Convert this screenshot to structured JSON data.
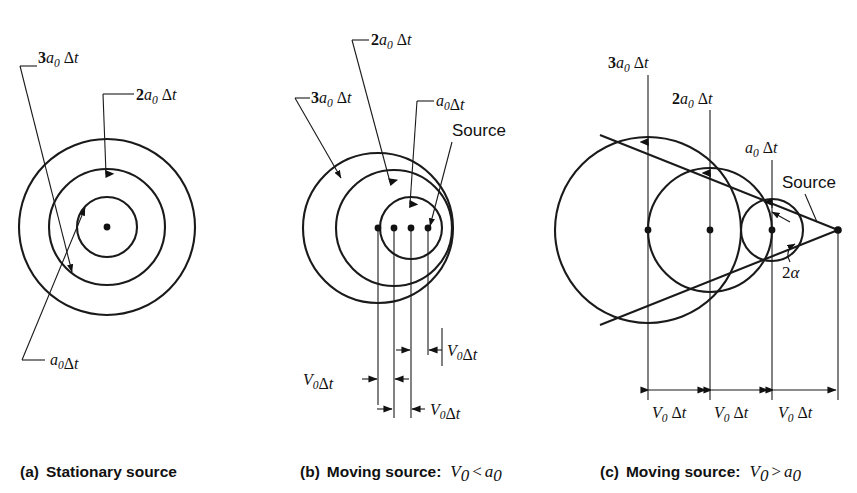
{
  "figure": {
    "background_color": "#ffffff",
    "ink_color": "#111111"
  },
  "panels": [
    {
      "id": "a",
      "caption_prefix": "(a)",
      "caption_text": "Stationary source",
      "caption_math": "",
      "description": "Three concentric circles around a single stationary source point",
      "source_label": "",
      "radius_labels": [
        {
          "name": "r3",
          "text": "3a0 Δt",
          "coef": "3",
          "symbol": "a",
          "sub": "0",
          "delta": "Δt"
        },
        {
          "name": "r2",
          "text": "2a0 Δt",
          "coef": "2",
          "symbol": "a",
          "sub": "0",
          "delta": "Δt"
        },
        {
          "name": "r1",
          "text": "a0 Δt",
          "coef": "",
          "symbol": "a",
          "sub": "0",
          "delta": "Δt"
        }
      ],
      "distance_labels": []
    },
    {
      "id": "b",
      "caption_prefix": "(b)",
      "caption_text": "Moving source:",
      "caption_math": "V0 < a0",
      "description": "Three non-concentric circles, subsonic source, four source positions",
      "source_label": "Source",
      "radius_labels": [
        {
          "name": "r3",
          "text": "3a0 Δt",
          "coef": "3",
          "symbol": "a",
          "sub": "0",
          "delta": "Δt"
        },
        {
          "name": "r2",
          "text": "2a0 Δt",
          "coef": "2",
          "symbol": "a",
          "sub": "0",
          "delta": "Δt"
        },
        {
          "name": "r1",
          "text": "a0 Δt",
          "coef": "",
          "symbol": "a",
          "sub": "0",
          "delta": "Δt"
        }
      ],
      "distance_labels": [
        {
          "name": "d1",
          "text": "V0 Δt",
          "symbol": "V",
          "sub": "0",
          "delta": "Δt"
        },
        {
          "name": "d2",
          "text": "V0 Δt",
          "symbol": "V",
          "sub": "0",
          "delta": "Δt"
        },
        {
          "name": "d3",
          "text": "V0 Δt",
          "symbol": "V",
          "sub": "0",
          "delta": "Δt"
        }
      ]
    },
    {
      "id": "c",
      "caption_prefix": "(c)",
      "caption_text": "Moving source:",
      "caption_math": "V0 > a0",
      "description": "Supersonic source with Mach cone tangent to three circles",
      "source_label": "Source",
      "angle_label": "2α",
      "radius_labels": [
        {
          "name": "r3",
          "text": "3a0 Δt",
          "coef": "3",
          "symbol": "a",
          "sub": "0",
          "delta": "Δt"
        },
        {
          "name": "r2",
          "text": "2a0 Δt",
          "coef": "2",
          "symbol": "a",
          "sub": "0",
          "delta": "Δt"
        },
        {
          "name": "r1",
          "text": "a0 Δt",
          "coef": "",
          "symbol": "a",
          "sub": "0",
          "delta": "Δt"
        }
      ],
      "distance_labels": [
        {
          "name": "d1",
          "text": "V0 Δt",
          "symbol": "V",
          "sub": "0",
          "delta": "Δt"
        },
        {
          "name": "d2",
          "text": "V0 Δt",
          "symbol": "V",
          "sub": "0",
          "delta": "Δt"
        },
        {
          "name": "d3",
          "text": "V0 Δt",
          "symbol": "V",
          "sub": "0",
          "delta": "Δt"
        }
      ]
    }
  ],
  "glyphs": {
    "delta": "Δ",
    "alpha": "α",
    "less_than": "<",
    "greater_than": ">",
    "t": "t",
    "two": "2"
  }
}
